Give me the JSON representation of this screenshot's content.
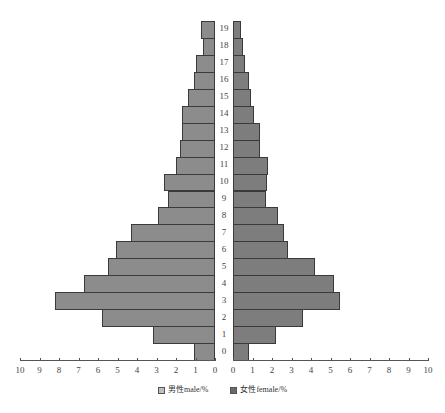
{
  "chart_data": {
    "type": "bar",
    "orientation": "horizontal-population-pyramid",
    "title": "",
    "xlabel": "",
    "ylabel": "",
    "categories": [
      "0",
      "1",
      "2",
      "3",
      "4",
      "5",
      "6",
      "7",
      "8",
      "9",
      "10",
      "11",
      "12",
      "13",
      "14",
      "15",
      "16",
      "17",
      "18",
      "19"
    ],
    "series": [
      {
        "name": "男性male/%",
        "side": "left",
        "values": [
          1.1,
          3.2,
          5.8,
          8.2,
          6.7,
          5.5,
          5.1,
          4.3,
          2.9,
          2.4,
          2.6,
          2.0,
          1.8,
          1.7,
          1.7,
          1.4,
          1.1,
          1.0,
          0.6,
          0.7
        ]
      },
      {
        "name": "女性female/%",
        "side": "right",
        "values": [
          0.8,
          2.2,
          3.6,
          5.5,
          5.2,
          4.2,
          2.8,
          2.6,
          2.3,
          1.7,
          1.75,
          1.8,
          1.4,
          1.4,
          1.1,
          0.9,
          0.8,
          0.6,
          0.5,
          0.4
        ]
      }
    ],
    "xlim_left": [
      10,
      0
    ],
    "xlim_right": [
      0,
      10
    ],
    "left_ticks": [
      "10",
      "9",
      "8",
      "7",
      "6",
      "5",
      "4",
      "3",
      "2",
      "1",
      "0"
    ],
    "right_ticks": [
      "0",
      "1",
      "2",
      "3",
      "4",
      "5",
      "6",
      "7",
      "8",
      "9",
      "10"
    ],
    "grid": false,
    "legend_position": "bottom"
  },
  "legend": {
    "male": "男性male/%",
    "female": "女性female/%"
  },
  "colors": {
    "male_bar": "#8c8c8c",
    "female_bar": "#7d7d7d",
    "outline": "#3a3a3a"
  }
}
